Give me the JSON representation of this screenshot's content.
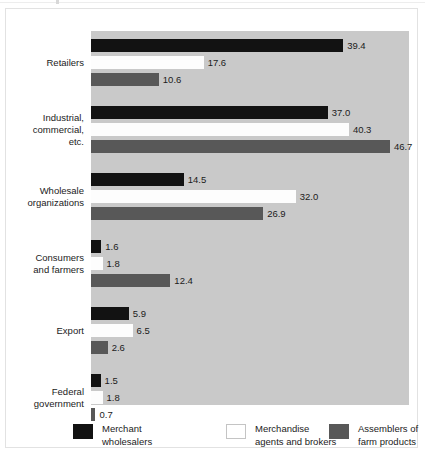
{
  "chart_data": {
    "type": "bar",
    "orientation": "horizontal",
    "grouped": true,
    "title": "",
    "subtitle": "",
    "xlabel": "",
    "ylabel": "",
    "grid": false,
    "legend_position": "bottom",
    "xlim": [
      0,
      50
    ],
    "categories": [
      "Retailers",
      "Industrial,\ncommercial,\netc.",
      "Wholesale\norganizations",
      "Consumers\nand farmers",
      "Export",
      "Federal\ngovernment"
    ],
    "series": [
      {
        "name": "Merchant\nwholesalers",
        "color": "#121212",
        "values": [
          39.4,
          37.0,
          14.5,
          1.6,
          5.9,
          1.5
        ],
        "labels": [
          "39.4",
          "37.0",
          "14.5",
          "1.6",
          "5.9",
          "1.5"
        ]
      },
      {
        "name": "Merchandise\nagents and brokers",
        "color": "#ffffff",
        "values": [
          17.6,
          40.3,
          32.0,
          1.8,
          6.5,
          1.8
        ],
        "labels": [
          "17.6",
          "40.3",
          "32.0",
          "1.8",
          "6.5",
          "1.8"
        ]
      },
      {
        "name": "Assemblers of\nfarm products",
        "color": "#585858",
        "values": [
          10.6,
          46.7,
          26.9,
          12.4,
          2.6,
          0.7
        ],
        "labels": [
          "10.6",
          "46.7",
          "26.9",
          "12.4",
          "2.6",
          "0.7"
        ]
      }
    ]
  },
  "legend": {
    "items": [
      {
        "label": "Merchant\nwholesalers",
        "swatch": "black-swatch"
      },
      {
        "label": "Merchandise\nagents and brokers",
        "swatch": "white-swatch"
      },
      {
        "label": "Assemblers of\nfarm products",
        "swatch": "gray-swatch"
      }
    ]
  },
  "colors": {
    "series_merchant": "#121212",
    "series_agents": "#ffffff",
    "series_assemblers": "#585858",
    "plot_background": "#c9c9c9",
    "page_background": "#ffffff",
    "text": "#1b1b1b"
  }
}
